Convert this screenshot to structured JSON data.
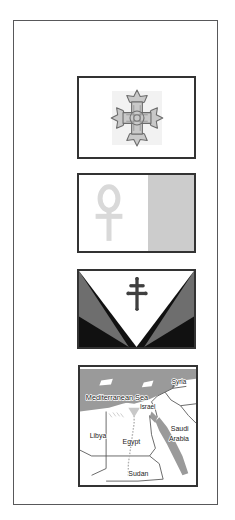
{
  "page": {
    "background_color": "#ffffff",
    "frame_color": "#58585a"
  },
  "panels": [
    {
      "id": "coptic-cross-flag",
      "name": "Coptic cross flag",
      "icon": "coptic-cross-icon",
      "background_color": "#ffffff",
      "symbol_color": "#8c8c8c",
      "border_color": "#333333"
    },
    {
      "id": "ankh-flag",
      "name": "Ankh flag",
      "icon": "ankh-icon",
      "left_half_color": "#ffffff",
      "right_half_color": "#cccccc",
      "symbol_color": "#d9d9d9",
      "border_color": "#333333"
    },
    {
      "id": "chevron-flag",
      "name": "Chevron flag with patriarchal cross",
      "icon": "patriarchal-cross-icon",
      "white_color": "#ffffff",
      "gray_color": "#6e6e6e",
      "black_color": "#111111",
      "symbol_color": "#3a3a3a",
      "border_color": "#333333"
    },
    {
      "id": "map",
      "name": "Map of Egypt and neighbouring countries",
      "land_color": "#ffffff",
      "sea_color": "#9a9a9a",
      "border_color": "#333333"
    }
  ],
  "map": {
    "labels": [
      {
        "text": "Mediterranean Sea",
        "x": 6,
        "y": 34,
        "kind": "sea"
      },
      {
        "text": "Syria",
        "x": 95,
        "y": 18,
        "kind": "country"
      },
      {
        "text": "Israel",
        "x": 64,
        "y": 43,
        "kind": "country"
      },
      {
        "text": "Libya",
        "x": 12,
        "y": 73,
        "kind": "country"
      },
      {
        "text": "Egypt",
        "x": 48,
        "y": 80,
        "kind": "country"
      },
      {
        "text": "Saudi",
        "x": 95,
        "y": 66,
        "kind": "country"
      },
      {
        "text": "Arabia",
        "x": 94,
        "y": 77,
        "kind": "country"
      },
      {
        "text": "Sudan",
        "x": 54,
        "y": 113,
        "kind": "country"
      }
    ]
  }
}
